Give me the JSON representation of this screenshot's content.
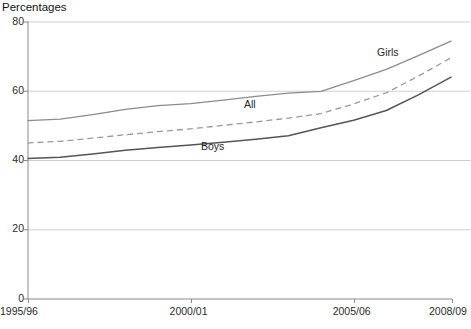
{
  "chart_data": {
    "type": "line",
    "title": "Percentages",
    "xlabel": "",
    "ylabel": "",
    "ylim": [
      0,
      80
    ],
    "ytick_values": [
      0,
      20,
      40,
      60,
      80
    ],
    "ytick_labels": [
      "0",
      "20",
      "40",
      "60",
      "80"
    ],
    "grid": true,
    "legend_position": "inline-annotations",
    "x": [
      "1995/96",
      "1996/97",
      "1997/98",
      "1998/99",
      "1999/00",
      "2000/01",
      "2001/02",
      "2002/03",
      "2003/04",
      "2004/05",
      "2005/06",
      "2006/07",
      "2007/08",
      "2008/09"
    ],
    "xtick_labels": [
      "1995/96",
      "2000/01",
      "2005/06",
      "2008/09"
    ],
    "xtick_positions": [
      "1995/96",
      "2000/01",
      "2005/06",
      "2008/09"
    ],
    "series": [
      {
        "name": "Girls",
        "color": "#8c8c8c",
        "style": "solid",
        "values": [
          51.4,
          51.8,
          53.1,
          54.6,
          55.7,
          56.3,
          57.3,
          58.4,
          59.3,
          59.8,
          62.9,
          66.2,
          70.2,
          74.4
        ]
      },
      {
        "name": "All",
        "color": "#9a9a9a",
        "style": "dashed",
        "values": [
          44.9,
          45.4,
          46.3,
          47.3,
          48.2,
          49.0,
          50.0,
          51.0,
          52.1,
          53.4,
          56.2,
          59.4,
          64.3,
          69.6
        ]
      },
      {
        "name": "Boys",
        "color": "#555555",
        "style": "solid",
        "values": [
          40.4,
          40.8,
          41.7,
          42.8,
          43.6,
          44.3,
          45.1,
          46.0,
          47.0,
          49.3,
          51.5,
          54.3,
          58.9,
          64.0
        ]
      }
    ],
    "annotations": [
      {
        "text": "Girls",
        "x_px": 377,
        "y_px": 46
      },
      {
        "text": "All",
        "x_px": 244,
        "y_px": 98
      },
      {
        "text": "Boys",
        "x_px": 201,
        "y_px": 140
      }
    ]
  }
}
